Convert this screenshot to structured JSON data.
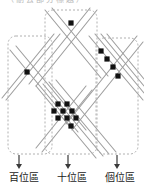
{
  "diagram": {
    "title_fragment": "（刪去部分標題）",
    "type": "lattice-multiplication-regions",
    "canvas": {
      "width": 144,
      "height": 187,
      "background": "#ffffff"
    },
    "colors": {
      "line": "#9a9a9a",
      "line_dark": "#7d7d7d",
      "dot": "#111111",
      "box_border": "#b0b0b0",
      "arrow": "#3a3a3a",
      "label_text": "#1a1a1a"
    },
    "regions": [
      {
        "id": "hundreds",
        "label": "百位區",
        "box": {
          "x": 8,
          "y": 36,
          "width": 44,
          "height": 118,
          "rx": 8
        },
        "arrow": {
          "x": 19,
          "y1": 155,
          "y2": 169
        },
        "dot_count": 1
      },
      {
        "id": "tens",
        "label": "十位區",
        "box": {
          "x": 45,
          "y": 10,
          "width": 52,
          "height": 144,
          "rx": 8
        },
        "arrow": {
          "x": 68,
          "y1": 155,
          "y2": 169
        },
        "dot_count": 10
      },
      {
        "id": "ones",
        "label": "個位區",
        "box": {
          "x": 96,
          "y": 38,
          "width": 42,
          "height": 116,
          "rx": 8
        },
        "arrow": {
          "x": 117,
          "y1": 155,
          "y2": 169
        },
        "dot_count": 4
      }
    ],
    "dots": {
      "hundreds": [
        {
          "x": 27,
          "y": 72
        }
      ],
      "tens": [
        {
          "x": 71,
          "y": 23
        },
        {
          "x": 58,
          "y": 104
        },
        {
          "x": 67,
          "y": 104
        },
        {
          "x": 54,
          "y": 111
        },
        {
          "x": 63,
          "y": 111
        },
        {
          "x": 72,
          "y": 111
        },
        {
          "x": 58,
          "y": 118
        },
        {
          "x": 67,
          "y": 118
        },
        {
          "x": 76,
          "y": 118
        },
        {
          "x": 71,
          "y": 126
        }
      ],
      "ones": [
        {
          "x": 101,
          "y": 51
        },
        {
          "x": 107,
          "y": 59
        },
        {
          "x": 113,
          "y": 67
        },
        {
          "x": 118,
          "y": 76
        }
      ]
    },
    "lines": {
      "down_right": [
        {
          "x1": 10,
          "y1": 50,
          "x2": 78,
          "y2": 132
        },
        {
          "x1": 16,
          "y1": 46,
          "x2": 86,
          "y2": 130
        },
        {
          "x1": 45,
          "y1": 10,
          "x2": 101,
          "y2": 78
        },
        {
          "x1": 52,
          "y1": 8,
          "x2": 108,
          "y2": 76
        },
        {
          "x1": 36,
          "y1": 86,
          "x2": 96,
          "y2": 158
        },
        {
          "x1": 43,
          "y1": 84,
          "x2": 103,
          "y2": 156
        },
        {
          "x1": 49,
          "y1": 82,
          "x2": 109,
          "y2": 154
        },
        {
          "x1": 56,
          "y1": 80,
          "x2": 116,
          "y2": 152
        },
        {
          "x1": 89,
          "y1": 36,
          "x2": 143,
          "y2": 100
        },
        {
          "x1": 95,
          "y1": 34,
          "x2": 144,
          "y2": 93
        },
        {
          "x1": 101,
          "y1": 34,
          "x2": 144,
          "y2": 86
        },
        {
          "x1": 107,
          "y1": 34,
          "x2": 144,
          "y2": 79
        }
      ],
      "down_left": [
        {
          "x1": 97,
          "y1": 10,
          "x2": 36,
          "y2": 86
        },
        {
          "x1": 90,
          "y1": 8,
          "x2": 29,
          "y2": 84
        },
        {
          "x1": 143,
          "y1": 42,
          "x2": 72,
          "y2": 130
        },
        {
          "x1": 137,
          "y1": 36,
          "x2": 66,
          "y2": 124
        },
        {
          "x1": 86,
          "y1": 86,
          "x2": 36,
          "y2": 148
        },
        {
          "x1": 92,
          "y1": 90,
          "x2": 42,
          "y2": 152
        },
        {
          "x1": 60,
          "y1": 34,
          "x2": 6,
          "y2": 100
        },
        {
          "x1": 54,
          "y1": 34,
          "x2": 2,
          "y2": 98
        }
      ]
    }
  }
}
